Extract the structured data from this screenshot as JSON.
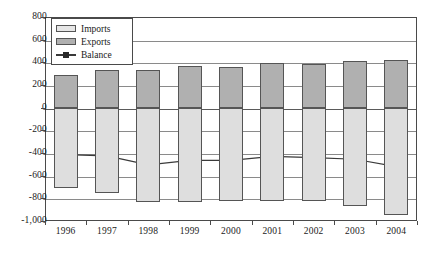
{
  "chart_data": {
    "type": "bar",
    "title": "",
    "subtitle": "",
    "xlabel": "",
    "ylabel": "",
    "categories": [
      "1996",
      "1997",
      "1998",
      "1999",
      "2000",
      "2001",
      "2002",
      "2003",
      "2004"
    ],
    "ylim": [
      -1000,
      800
    ],
    "yticks": [
      800,
      600,
      400,
      200,
      0,
      -200,
      -400,
      -600,
      -800,
      -1000
    ],
    "ytick_labels": [
      "800",
      "600",
      "400",
      "200",
      "0",
      "-200",
      "-400",
      "-600",
      "-800",
      "-1,000"
    ],
    "grid": true,
    "legend_position": "top-left",
    "series": [
      {
        "name": "Exports",
        "type": "bar",
        "color": "#b0b0b0",
        "values": [
          290,
          330,
          330,
          365,
          355,
          390,
          385,
          410,
          425
        ]
      },
      {
        "name": "Imports",
        "type": "bar",
        "color": "#dedede",
        "values": [
          -705,
          -755,
          -835,
          -830,
          -820,
          -820,
          -825,
          -865,
          -945
        ]
      },
      {
        "name": "Balance",
        "type": "line",
        "color": "#3a3a3a",
        "values": [
          -415,
          -425,
          -505,
          -465,
          -465,
          -430,
          -440,
          -455,
          -520
        ]
      }
    ]
  },
  "legend": {
    "items": [
      {
        "label": "Imports",
        "marker": "square-light"
      },
      {
        "label": "Exports",
        "marker": "square-dark"
      },
      {
        "label": "Balance",
        "marker": "line-square"
      }
    ]
  }
}
